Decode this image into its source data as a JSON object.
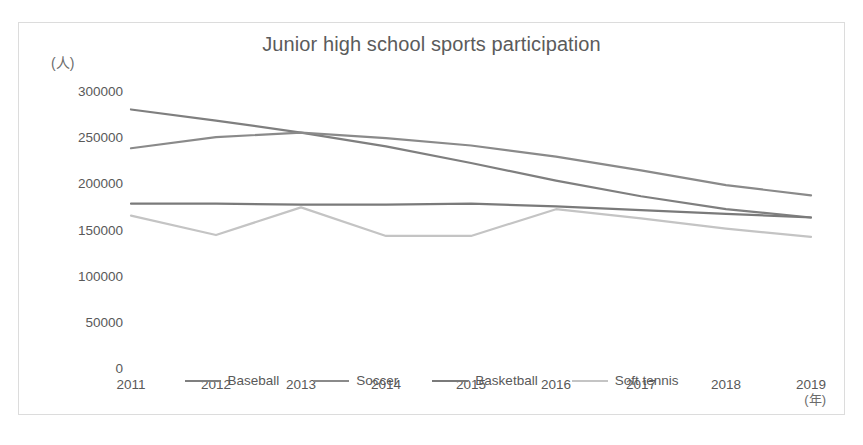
{
  "chart_data": {
    "type": "line",
    "title": "Junior high school sports participation",
    "xlabel": "(年)",
    "ylabel": "(人)",
    "categories": [
      "2011",
      "2012",
      "2013",
      "2014",
      "2015",
      "2016",
      "2017",
      "2018",
      "2019"
    ],
    "x": [
      2011,
      2012,
      2013,
      2014,
      2015,
      2016,
      2017,
      2018,
      2019
    ],
    "ylim": [
      0,
      300000
    ],
    "yticks": [
      300000,
      250000,
      200000,
      150000,
      100000,
      50000,
      0
    ],
    "ytick_labels": [
      "300000",
      "250000",
      "200000",
      "150000",
      "100000",
      "50000",
      "0"
    ],
    "grid": false,
    "legend_position": "bottom",
    "series": [
      {
        "name": "Baseball",
        "color": "#7f7f7f",
        "values": [
          280000,
          268000,
          255000,
          240000,
          222000,
          203000,
          186000,
          172000,
          163000
        ]
      },
      {
        "name": "Soccer",
        "color": "#8a8a8a",
        "values": [
          238000,
          250000,
          255000,
          249000,
          241000,
          229000,
          214000,
          198000,
          187000
        ]
      },
      {
        "name": "Basketball",
        "color": "#7a7a7a",
        "values": [
          178000,
          178000,
          177000,
          177000,
          178000,
          175000,
          171000,
          167000,
          163000
        ]
      },
      {
        "name": "Soft tennis",
        "color": "#c4c4c4",
        "values": [
          165000,
          144000,
          174000,
          143000,
          143000,
          172000,
          162000,
          151000,
          142000
        ]
      }
    ]
  }
}
